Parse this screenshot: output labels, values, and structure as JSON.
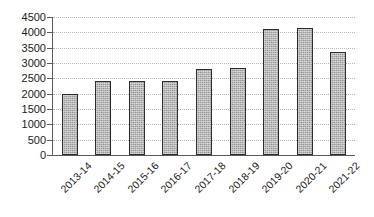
{
  "chart_data": {
    "type": "bar",
    "title": "",
    "subtitle": "",
    "xlabel": "",
    "ylabel": "",
    "categories": [
      "2013-14",
      "2014-15",
      "2015-16",
      "2016-17",
      "2017-18",
      "2018-19",
      "2019-20",
      "2020-21",
      "2021-22"
    ],
    "values": [
      1980,
      2410,
      2410,
      2410,
      2820,
      2830,
      4120,
      4140,
      3350
    ],
    "series": [
      {
        "name": "",
        "values": [
          1980,
          2410,
          2410,
          2410,
          2820,
          2830,
          4120,
          4140,
          3350
        ]
      }
    ],
    "ylim": [
      0,
      4500
    ],
    "ytick_step": 500,
    "yticks": [
      0,
      500,
      1000,
      1500,
      2000,
      2500,
      3000,
      3500,
      4000,
      4500
    ],
    "ytick_labels": [
      "0",
      "500",
      "1000",
      "1500",
      "2000",
      "2500",
      "3000",
      "3500",
      "4000",
      "4500"
    ],
    "xtick_label_rotation": -45,
    "grid": true,
    "grid_axis": "y",
    "grid_style": "dotted",
    "legend": false,
    "legend_position": "none",
    "bar_fill_color": "#9e9e9e",
    "bar_edge_color": "#2e2e2e",
    "grid_color": "#b4b4b4",
    "axis_color": "#5a5a5a",
    "text_color": "#1b1b1b",
    "background_color": "#ffffff"
  }
}
